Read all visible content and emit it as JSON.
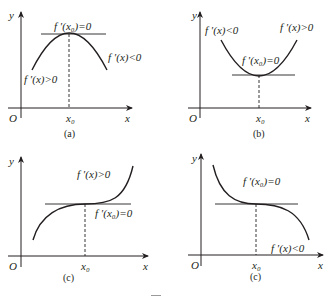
{
  "figure": {
    "caption_fragment": "图",
    "panels": [
      {
        "id": "a",
        "caption": "(a)",
        "axis_y_label": "y",
        "axis_x_label": "x",
        "origin_label": "O",
        "x0_label": "x₀",
        "tangent_label": "f ′(x₀)=0",
        "left_label": "f ′(x)>0",
        "right_label": "f ′(x)<0",
        "shape": "local maximum"
      },
      {
        "id": "b",
        "caption": "(b)",
        "axis_y_label": "y",
        "axis_x_label": "x",
        "origin_label": "O",
        "x0_label": "x₀",
        "tangent_label": "f ′(x₀)=0",
        "left_label": "f ′(x)<0",
        "right_label": "f ′(x)>0",
        "shape": "local minimum"
      },
      {
        "id": "c",
        "caption": "(c)",
        "axis_y_label": "y",
        "axis_x_label": "x",
        "origin_label": "O",
        "x0_label": "x₀",
        "tangent_label": "f ′(x₀)=0",
        "slope_label": "f ′(x)>0",
        "shape": "increasing inflection"
      },
      {
        "id": "d",
        "caption": "(c)",
        "axis_y_label": "y",
        "axis_x_label": "x",
        "origin_label": "O",
        "x0_label": "x₀",
        "tangent_label": "f ′(x₀)=0",
        "slope_label": "f ′(x)<0",
        "shape": "decreasing inflection"
      }
    ]
  }
}
